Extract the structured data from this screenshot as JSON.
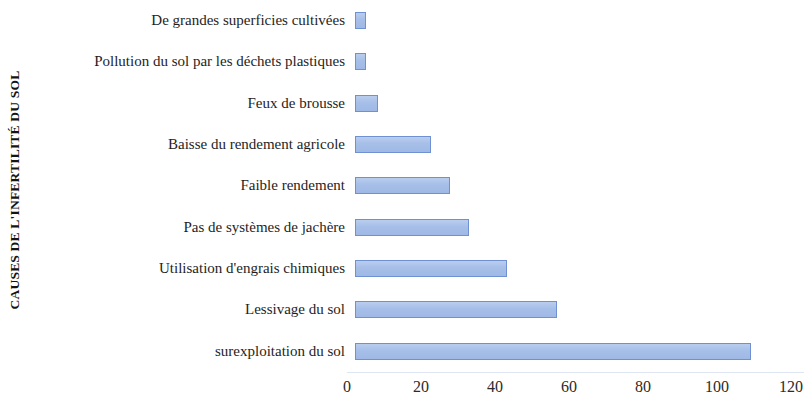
{
  "chart_data": {
    "type": "bar",
    "orientation": "horizontal",
    "title": "",
    "xlabel": "",
    "ylabel": "CAUSES DE L'INFERTILITÉ DU SOL",
    "categories": [
      "De grandes superficies cultivées",
      "Pollution du sol par les déchets plastiques",
      "Feux de brousse",
      "Baisse du rendement agricole",
      "Faible rendement",
      "Pas de systèmes de jachère",
      "Utilisation d'engrais chimiques",
      "Lessivage du sol",
      "surexploitation du sol"
    ],
    "values": [
      3,
      3,
      6,
      20,
      25,
      30,
      40,
      53,
      104
    ],
    "xlim": [
      0,
      120
    ],
    "xticks": [
      0,
      20,
      40,
      60,
      80,
      100,
      120
    ],
    "xtick_labels": [
      "0",
      "20",
      "40",
      "60",
      "80",
      "100",
      "120"
    ],
    "grid": false,
    "legend": false,
    "bar_fill_color": "#a6bfe8",
    "bar_border_color": "#6f91d3",
    "background_color": "#ffffff"
  }
}
